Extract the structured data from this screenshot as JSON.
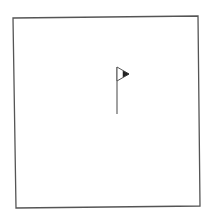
{
  "drawing": {
    "background": "#ffffff",
    "stroke_color": "#555555",
    "frame": {
      "shape": "quadrilateral",
      "points": [
        [
          13,
          18
        ],
        [
          198,
          16
        ],
        [
          200,
          206
        ],
        [
          16,
          208
        ]
      ]
    },
    "flag": {
      "pole": {
        "x": 117,
        "y_top": 67,
        "y_bottom": 114
      },
      "pennant": {
        "points": [
          [
            117,
            67
          ],
          [
            129,
            74
          ],
          [
            117,
            81
          ]
        ],
        "filled_tip": [
          [
            123,
            71
          ],
          [
            129,
            74
          ],
          [
            123,
            77
          ]
        ],
        "direction": "right"
      }
    }
  }
}
